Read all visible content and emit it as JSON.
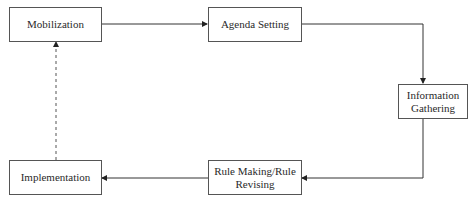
{
  "diagram": {
    "type": "process-cycle",
    "nodes": [
      {
        "id": "mobilization",
        "label": "Mobilization"
      },
      {
        "id": "agenda",
        "label": "Agenda Setting"
      },
      {
        "id": "info",
        "label": "Information Gathering"
      },
      {
        "id": "rule",
        "label": "Rule Making/Rule Revising"
      },
      {
        "id": "implementation",
        "label": "Implementation"
      }
    ],
    "edges": [
      {
        "from": "mobilization",
        "to": "agenda",
        "style": "solid"
      },
      {
        "from": "agenda",
        "to": "info",
        "style": "solid"
      },
      {
        "from": "info",
        "to": "rule",
        "style": "solid"
      },
      {
        "from": "rule",
        "to": "implementation",
        "style": "solid"
      },
      {
        "from": "implementation",
        "to": "mobilization",
        "style": "dashed"
      }
    ],
    "colors": {
      "line": "#333333",
      "box_border": "#555555",
      "text": "#2a2a2a"
    }
  }
}
